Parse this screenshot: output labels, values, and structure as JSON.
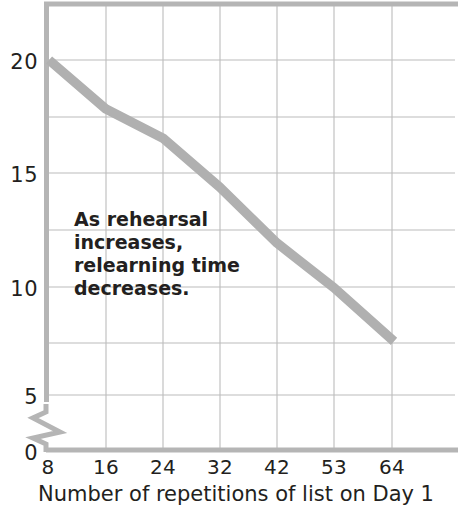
{
  "chart_data": {
    "type": "line",
    "title": "",
    "subtitle": "",
    "xlabel": "Number of repetitions of list on Day 1",
    "ylabel": "",
    "x": [
      8,
      16,
      24,
      32,
      42,
      53,
      64
    ],
    "xtick_labels": [
      "8",
      "16",
      "24",
      "32",
      "42",
      "53",
      "64"
    ],
    "values": [
      20.0,
      17.8,
      16.5,
      14.3,
      11.8,
      9.8,
      7.4
    ],
    "series": [
      {
        "name": "Relearning time",
        "values": [
          20.0,
          17.8,
          16.5,
          14.3,
          11.8,
          9.8,
          7.4
        ],
        "color": "#b0b0b0"
      }
    ],
    "ytick_labels": [
      "20",
      "15",
      "10",
      "5",
      "0"
    ],
    "ytick_values": [
      20,
      15,
      10,
      5,
      0
    ],
    "ylim": [
      5,
      22.5
    ],
    "y_gridline_values": [
      20,
      17.5,
      15,
      12.5,
      10,
      7.5,
      5
    ],
    "axis_break": true,
    "axis_break_note": "zigzag break on y-axis between 0 and 5",
    "grid": true,
    "legend": "none",
    "annotations": [
      {
        "text": "As rehearsal increases, relearning time decreases.",
        "lines": [
          "As rehearsal",
          "increases,",
          "relearning time",
          "decreases."
        ],
        "x": 8,
        "y": 12.5
      }
    ],
    "colors": {
      "line": "#b0b0b0",
      "grid": "#b9b9b9",
      "axis": "#c3c3c3",
      "text": "#231f20",
      "background": "#ffffff"
    }
  },
  "axes": {
    "y_ticks": [
      {
        "label": "20",
        "top": 50
      },
      {
        "label": "15",
        "top": 163
      },
      {
        "label": "10",
        "top": 277
      },
      {
        "label": "5",
        "top": 385
      },
      {
        "label": "0",
        "top": 441
      }
    ],
    "x_ticks": [
      {
        "label": "8",
        "left": 26
      },
      {
        "label": "16",
        "left": 84
      },
      {
        "label": "24",
        "left": 141
      },
      {
        "label": "32",
        "left": 198
      },
      {
        "label": "42",
        "left": 255
      },
      {
        "label": "53",
        "left": 312
      },
      {
        "label": "64",
        "left": 370
      }
    ]
  }
}
